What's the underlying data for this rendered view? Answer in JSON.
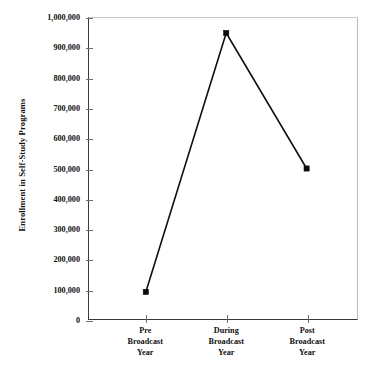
{
  "chart_data": {
    "type": "line",
    "title": "",
    "xlabel": "",
    "ylabel": "Enrollment in Self-Study Programs",
    "categories": [
      "Pre Broadcast Year",
      "During Broadcast Year",
      "Post Broadcast Year"
    ],
    "category_lines": [
      [
        "Pre",
        "Broadcast",
        "Year"
      ],
      [
        "During",
        "Broadcast",
        "Year"
      ],
      [
        "Post",
        "Broadcast",
        "Year"
      ]
    ],
    "values": [
      90000,
      950000,
      500000
    ],
    "series": [
      {
        "name": "Enrollment in Self-Study Programs",
        "values": [
          90000,
          950000,
          500000
        ]
      }
    ],
    "ylim": [
      0,
      1000000
    ],
    "ytick_values": [
      0,
      100000,
      200000,
      300000,
      400000,
      500000,
      600000,
      700000,
      800000,
      900000,
      1000000
    ],
    "ytick_labels": [
      "0",
      "100,000",
      "200,000",
      "300,000",
      "400,000",
      "500,000",
      "600,000",
      "700,000",
      "800,000",
      "900,000",
      "1,000,000"
    ],
    "grid": false,
    "legend": false,
    "legend_position": "none",
    "marker": "square",
    "line_color": "#101010",
    "marker_color": "#0b0b0b",
    "axis_color": "#3a3a3a",
    "background_color": "#ffffff"
  }
}
